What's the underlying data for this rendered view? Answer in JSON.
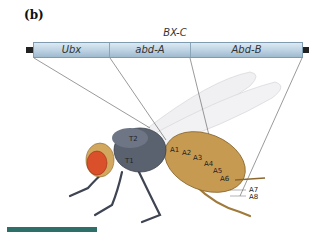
{
  "figure": {
    "panel_label": "(b)",
    "cluster_label": "BX-C",
    "genes": [
      {
        "name": "Ubx"
      },
      {
        "name": "abd-A"
      },
      {
        "name": "Abd-B"
      }
    ],
    "segment_labels": [
      "T1",
      "T2",
      "A1",
      "A2",
      "A3",
      "A4",
      "A5",
      "A6",
      "A7",
      "A8"
    ],
    "colors": {
      "gene_bar": "#b9cfe0",
      "fly_body": "#c79a52",
      "fly_thorax": "#5a6270",
      "eye": "#d9502a",
      "accent_bar": "#2f6f6a"
    }
  }
}
